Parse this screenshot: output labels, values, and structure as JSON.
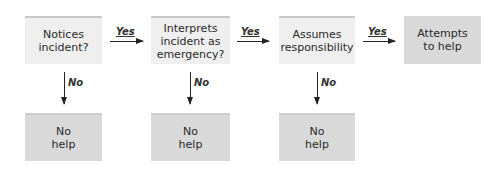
{
  "diagram": {
    "type": "flowchart",
    "steps": [
      {
        "id": "notices",
        "label": "Notices\nincident?",
        "kind": "decision"
      },
      {
        "id": "interprets",
        "label": "Interprets\nincident as\nemergency?",
        "kind": "decision"
      },
      {
        "id": "assumes",
        "label": "Assumes\nresponsibility",
        "kind": "decision"
      },
      {
        "id": "attempts",
        "label": "Attempts\nto help",
        "kind": "outcome"
      }
    ],
    "no_outcomes": [
      {
        "label": "No\nhelp"
      },
      {
        "label": "No\nhelp"
      },
      {
        "label": "No\nhelp"
      }
    ],
    "edges": {
      "yes_label": "Yes",
      "no_label": "No"
    }
  }
}
